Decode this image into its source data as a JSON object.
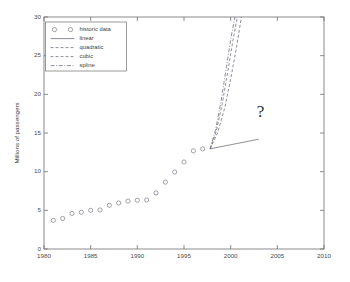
{
  "chart_data": {
    "type": "scatter",
    "title": "",
    "xlabel": "",
    "ylabel": "Millions of passengers",
    "xlim": [
      1980,
      2010
    ],
    "ylim": [
      0,
      30
    ],
    "xticks": [
      1980,
      1985,
      1990,
      1995,
      2000,
      2005,
      2010
    ],
    "yticks": [
      0,
      5,
      10,
      15,
      20,
      25,
      30
    ],
    "grid": false,
    "legend_position": "upper left",
    "legend": [
      "historic data",
      "linear",
      "quadratic",
      "cubic",
      "spline"
    ],
    "annotations": [
      {
        "text": "?",
        "x": 2003.2,
        "y": 17.6
      }
    ],
    "series": [
      {
        "name": "historic data",
        "type": "scatter",
        "marker": "circle",
        "x": [
          1981,
          1982,
          1983,
          1984,
          1985,
          1986,
          1987,
          1988,
          1989,
          1990,
          1991,
          1992,
          1993,
          1994,
          1995,
          1996,
          1997
        ],
        "y": [
          3.7,
          3.95,
          4.6,
          4.75,
          5.0,
          5.05,
          5.65,
          5.95,
          6.2,
          6.3,
          6.35,
          7.25,
          8.65,
          9.95,
          11.25,
          12.7,
          12.95
        ]
      },
      {
        "name": "linear",
        "type": "line",
        "style": "solid",
        "x": [
          1997.8,
          2003.0
        ],
        "y": [
          12.95,
          14.2
        ]
      },
      {
        "name": "quadratic",
        "type": "line",
        "style": "dashed",
        "x": [
          1997.8,
          1998.6,
          1999.4,
          2000.1,
          2000.7,
          2001.15
        ],
        "y": [
          12.95,
          15.0,
          18.4,
          22.6,
          26.6,
          30.0
        ]
      },
      {
        "name": "cubic",
        "type": "line",
        "style": "dashed",
        "x": [
          1997.8,
          1998.45,
          1999.1,
          1999.7,
          2000.25,
          2000.7
        ],
        "y": [
          12.95,
          15.2,
          18.8,
          23.0,
          27.0,
          30.0
        ]
      },
      {
        "name": "spline",
        "type": "line",
        "style": "dashdot",
        "x": [
          1997.8,
          1998.4,
          1999.0,
          1999.55,
          2000.05,
          2000.45
        ],
        "y": [
          12.95,
          15.5,
          19.3,
          23.6,
          27.4,
          30.0
        ]
      }
    ]
  },
  "axes": {
    "y_title": "Millions of passengers"
  }
}
